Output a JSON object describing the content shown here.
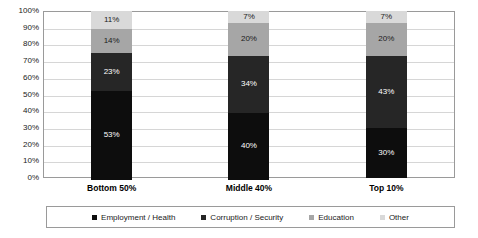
{
  "chart_data": {
    "type": "bar",
    "subtype": "100% stacked column",
    "title": "",
    "subtitle": "",
    "xlabel": "",
    "ylabel": "",
    "ylim": [
      0,
      100
    ],
    "grid": true,
    "legend_position": "bottom",
    "categories": [
      "Bottom 50%",
      "Middle 40%",
      "Top 10%"
    ],
    "y_ticks": [
      "0%",
      "10%",
      "20%",
      "30%",
      "40%",
      "50%",
      "60%",
      "70%",
      "80%",
      "90%",
      "100%"
    ],
    "series": [
      {
        "name": "Employment / Health",
        "color": "#0d0d0d",
        "label_color": "#ffffff",
        "values": [
          53,
          40,
          30
        ],
        "labels": [
          "53%",
          "40%",
          "30%"
        ]
      },
      {
        "name": "Corruption / Security",
        "color": "#262626",
        "label_color": "#ffffff",
        "values": [
          23,
          34,
          43
        ],
        "labels": [
          "23%",
          "34%",
          "43%"
        ]
      },
      {
        "name": "Education",
        "color": "#a6a6a6",
        "label_color": "#1a1a1a",
        "values": [
          14,
          20,
          20
        ],
        "labels": [
          "14%",
          "20%",
          "20%"
        ]
      },
      {
        "name": "Other",
        "color": "#d9d9d9",
        "label_color": "#1a1a1a",
        "values": [
          11,
          7,
          7
        ],
        "labels": [
          "11%",
          "7%",
          "7%"
        ]
      }
    ]
  },
  "legend": {
    "items": [
      {
        "label": "Employment / Health",
        "color": "#0d0d0d"
      },
      {
        "label": "Corruption / Security",
        "color": "#262626"
      },
      {
        "label": "Education",
        "color": "#a6a6a6"
      },
      {
        "label": "Other",
        "color": "#d9d9d9"
      }
    ]
  }
}
